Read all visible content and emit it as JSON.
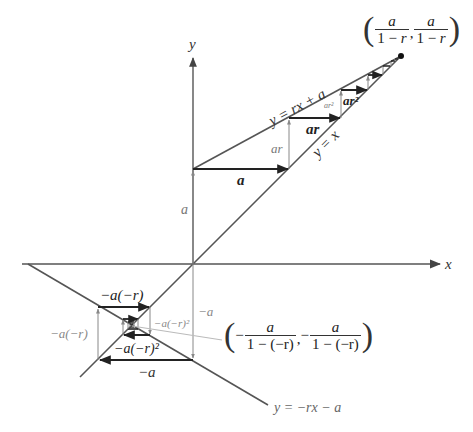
{
  "diagram": {
    "type": "cobweb-geometric-series",
    "axes": {
      "x_label": "x",
      "y_label": "y"
    },
    "lines": {
      "upper": "y = rx + a",
      "diagonal": "y = x",
      "lower": "y = −rx − a"
    },
    "upper_steps": {
      "a_vertical": "a",
      "a_horizontal": "a",
      "ar_vertical": "ar",
      "ar_horizontal": "ar",
      "ar2_vertical": "ar²",
      "ar2_horizontal": "ar²"
    },
    "lower_steps": {
      "neg_a_vertical": "−a",
      "neg_a_horizontal": "−a",
      "neg_ar_vertical": "−a(−r)",
      "neg_ar_horizontal": "−a(−r)",
      "neg_ar2_vertical": "−a(−r)²",
      "neg_ar2_horizontal": "−a(−r)²"
    },
    "fixed_points": {
      "positive": {
        "x_num": "a",
        "x_den_pre": "1 − ",
        "x_den_var": "r",
        "y_num": "a",
        "y_den_pre": "1 − ",
        "y_den_var": "r"
      },
      "negative": {
        "x_sign": "−",
        "x_num": "a",
        "x_den": "1 − (−r)",
        "y_sign": "−",
        "y_num": "a",
        "y_den": "1 − (−r)"
      }
    },
    "colors": {
      "line": "#555555",
      "arrow_dark": "#222222",
      "arrow_light": "#888888",
      "pointer": "#bbbbbb"
    }
  }
}
